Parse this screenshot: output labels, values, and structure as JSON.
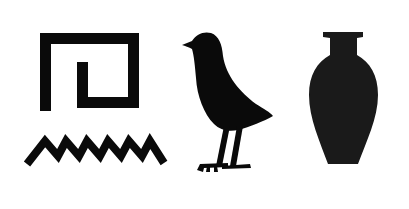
{
  "title": "Egyptian hieroglyphs",
  "glyphs": [
    {
      "name": "spiral",
      "label": "Twisted flax / spiral sign",
      "color": "#0a0a0a"
    },
    {
      "name": "water-ripple",
      "label": "Water ripple (zigzag) sign",
      "color": "#0a0a0a"
    },
    {
      "name": "bird",
      "label": "Bird sign",
      "color": "#0a0a0a"
    },
    {
      "name": "vase",
      "label": "Jar / vase sign",
      "color": "#1a1a1a"
    }
  ],
  "background": "#ffffff"
}
